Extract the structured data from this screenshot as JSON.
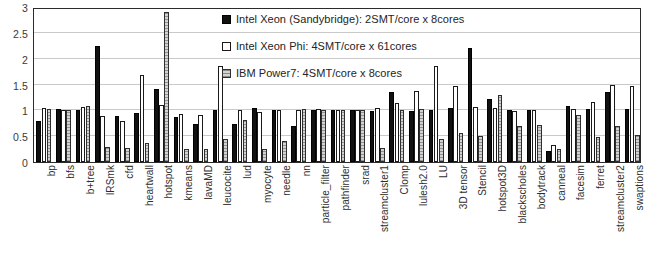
{
  "chart_data": {
    "type": "bar",
    "title": "",
    "xlabel": "",
    "ylabel": "",
    "ylim": [
      0,
      3
    ],
    "ytick_labels": [
      "0",
      "0.5",
      "1",
      "1.5",
      "2",
      "2.5",
      "3"
    ],
    "ytick_values": [
      0,
      0.5,
      1,
      1.5,
      2,
      2.5,
      3
    ],
    "grid": true,
    "legend_position": "top-center",
    "categories": [
      "bp",
      "bfs",
      "b+tree",
      "lRSmk",
      "cfd",
      "heartwall",
      "hotspot",
      "kmeans",
      "lavaMD",
      "leucocite",
      "lud",
      "myocyte",
      "needle",
      "nn",
      "particle_filter",
      "pathfinder",
      "srad",
      "streamcluster1",
      "Clomp",
      "lulesh2.0",
      "LU",
      "3D tensor",
      "Stencil",
      "hotspot3D",
      "blackscholes",
      "bodytrack",
      "canneal",
      "facesim",
      "ferret",
      "streamcluster2",
      "swaptions"
    ],
    "series": [
      {
        "name": "Intel Xeon (Sandybridge): 2SMT/core x 8cores",
        "color": "#111111",
        "values": [
          0.8,
          1.02,
          1.0,
          2.25,
          0.89,
          0.95,
          1.42,
          0.87,
          0.73,
          1.0,
          0.74,
          1.05,
          1.0,
          0.7,
          1.0,
          1.0,
          1.0,
          0.98,
          1.35,
          0.99,
          1.0,
          1.04,
          2.2,
          1.22,
          1.0,
          1.0,
          0.22,
          1.08,
          1.02,
          1.35,
          1.02
        ]
      },
      {
        "name": "Intel Xeon Phi: 4SMT/core x 61cores",
        "color": "#ffffff",
        "values": [
          1.05,
          1.0,
          1.07,
          0.9,
          0.8,
          1.68,
          1.11,
          0.93,
          0.91,
          1.85,
          1.01,
          0.96,
          1.01,
          1.0,
          1.03,
          1.0,
          1.01,
          1.05,
          1.14,
          1.38,
          1.85,
          1.48,
          1.07,
          1.04,
          0.99,
          1.0,
          0.32,
          1.02,
          1.17,
          1.5,
          1.47
        ]
      },
      {
        "name": "IBM Power7: 4SMT/core x 8cores",
        "color": "#d3d3d3",
        "values": [
          1.02,
          1.01,
          1.09,
          0.3,
          0.27,
          0.36,
          2.9,
          0.26,
          0.26,
          0.44,
          0.81,
          0.26,
          0.4,
          1.02,
          1.01,
          1.0,
          1.0,
          0.27,
          1.0,
          1.03,
          0.44,
          0.56,
          0.5,
          1.3,
          0.69,
          0.72,
          0.25,
          0.91,
          0.48,
          0.7,
          0.52
        ]
      }
    ]
  },
  "legend": {
    "entries": [
      {
        "label": "Intel Xeon (Sandybridge): 2SMT/core x 8cores",
        "swatch": "filled-black-square"
      },
      {
        "label": "Intel Xeon Phi: 4SMT/core x 61cores",
        "swatch": "hollow-white-square"
      },
      {
        "label": "IBM Power7: 4SMT/core x 8cores",
        "swatch": "hatched-gray-square"
      }
    ]
  }
}
